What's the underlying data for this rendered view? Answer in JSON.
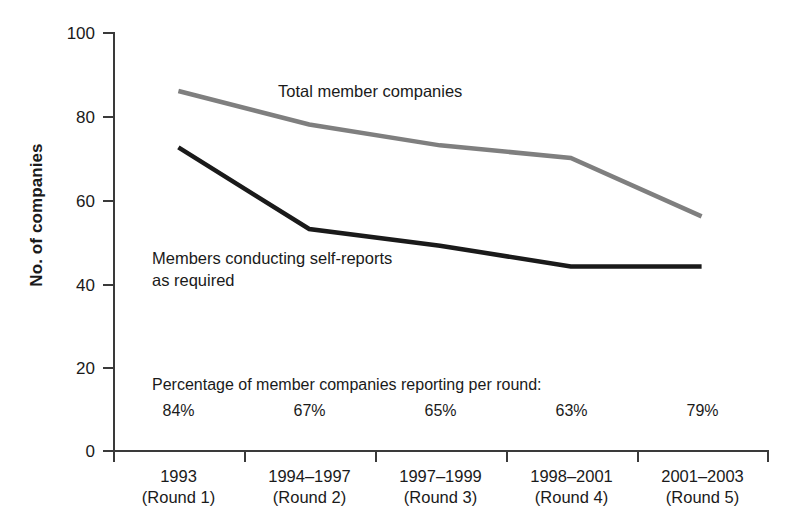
{
  "chart_data": {
    "type": "line",
    "title": "",
    "xlabel": "",
    "ylabel": "No. of companies",
    "ylim": [
      0,
      100
    ],
    "yticks": [
      0,
      20,
      40,
      60,
      80,
      100
    ],
    "grid": false,
    "legend": "inline-annotations",
    "categories": [
      "1993\n(Round 1)",
      "1994–1997\n(Round 2)",
      "1997–1999\n(Round 3)",
      "1998–2001\n(Round 4)",
      "2001–2003\n(Round 5)"
    ],
    "category_lines": [
      {
        "top": "1993",
        "bottom": "(Round 1)"
      },
      {
        "top": "1994–1997",
        "bottom": "(Round 2)"
      },
      {
        "top": "1997–1999",
        "bottom": "(Round 3)"
      },
      {
        "top": "1998–2001",
        "bottom": "(Round 4)"
      },
      {
        "top": "2001–2003",
        "bottom": "(Round 5)"
      }
    ],
    "series": [
      {
        "name": "Total member companies",
        "color": "#7f7f7f",
        "values": [
          86,
          78,
          73,
          70,
          56
        ]
      },
      {
        "name": "Members conducting self-reports as required",
        "color": "#1a1a1a",
        "values": [
          72.5,
          53,
          49,
          44,
          44
        ]
      }
    ],
    "annotations": {
      "gray_label": "Total member companies",
      "black_label_line1": "Members conducting self-reports",
      "black_label_line2": "as required",
      "percentage_caption": "Percentage of member companies reporting per round:",
      "percentages": [
        "84%",
        "67%",
        "65%",
        "63%",
        "79%"
      ]
    }
  },
  "axis": {
    "y_title": "No. of companies",
    "y_tick_labels": [
      "100",
      "80",
      "60",
      "40",
      "20",
      "0"
    ]
  }
}
